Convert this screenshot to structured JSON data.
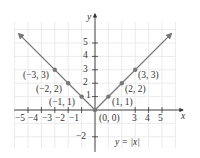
{
  "chart_data": {
    "type": "line",
    "title": "",
    "equation_label": "y = |x|",
    "xlabel": "x",
    "ylabel": "y",
    "xlim": [
      -6,
      6
    ],
    "ylim": [
      -3,
      6.5
    ],
    "grid": true,
    "x_ticks": [
      -5,
      -4,
      -3,
      -2,
      -1,
      3,
      4,
      5
    ],
    "x_tick_labels": [
      "−5",
      "−4",
      "−3",
      "−2",
      "−1",
      "3",
      "4",
      "5"
    ],
    "y_ticks": [
      5,
      4,
      3,
      2,
      1,
      -2
    ],
    "y_tick_labels": [
      "5",
      "4",
      "3",
      "2",
      "1",
      "−2"
    ],
    "series": [
      {
        "name": "y = |x|",
        "x": [
          -5.7,
          0,
          5.7
        ],
        "y": [
          5.7,
          0,
          5.7
        ],
        "color": "#777777",
        "arrows": true
      }
    ],
    "points": [
      {
        "x": -3,
        "y": 3,
        "label": "(−3, 3)"
      },
      {
        "x": -2,
        "y": 2,
        "label": "(−2, 2)"
      },
      {
        "x": -1,
        "y": 1,
        "label": "(−1, 1)"
      },
      {
        "x": 0,
        "y": 0,
        "label": "(0, 0)"
      },
      {
        "x": 1,
        "y": 1,
        "label": "(1, 1)"
      },
      {
        "x": 2,
        "y": 2,
        "label": "(2, 2)"
      },
      {
        "x": 3,
        "y": 3,
        "label": "(3, 3)"
      }
    ],
    "colors": {
      "line": "#777777",
      "point": "#777777",
      "axis": "#333333",
      "grid": "#e6e6e6"
    }
  }
}
